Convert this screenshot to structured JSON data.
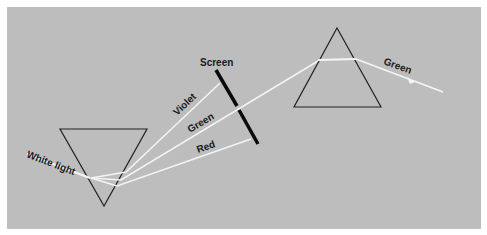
{
  "colors": {
    "background_panel": "#bdbdbd",
    "border": "#ffffff",
    "light_rays": "#f4f4f4",
    "prism_outline": "#222222",
    "screen": "#0a0a0a"
  },
  "labels": {
    "white_light": "White light",
    "screen": "Screen",
    "violet": "Violet",
    "green_first": "Green",
    "red": "Red",
    "green_second": "Green"
  },
  "elements": {
    "first_prism": "inverted-triangle prism",
    "second_prism": "upright-triangle prism",
    "screen": "opaque screen with slit"
  }
}
